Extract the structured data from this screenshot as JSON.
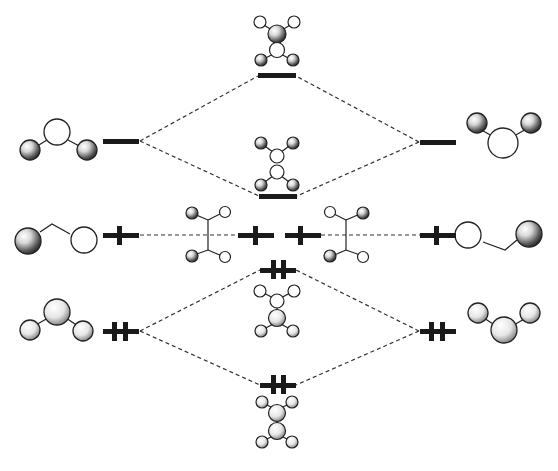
{
  "diagram": {
    "type": "molecular-orbital-energy-diagram",
    "colors": {
      "level": "#1a1a1a",
      "dashed_line": "#333333",
      "lobe_outline": "#222222",
      "filled_lobe_dark": "#1e1e1e",
      "filled_lobe_light": "#ffffff"
    },
    "levels": [
      {
        "id": "left-top",
        "x": 103,
        "y": 141,
        "width": 36,
        "electrons": 0
      },
      {
        "id": "right-top",
        "x": 420,
        "y": 142,
        "width": 36,
        "electrons": 0
      },
      {
        "id": "center-top-upper",
        "x": 258,
        "y": 76,
        "width": 38,
        "electrons": 0
      },
      {
        "id": "center-top-lower",
        "x": 259,
        "y": 196,
        "width": 38,
        "electrons": 0
      },
      {
        "id": "left-mid",
        "x": 103,
        "y": 235,
        "width": 36,
        "electrons": 1
      },
      {
        "id": "center-mid-left",
        "x": 238,
        "y": 235,
        "width": 36,
        "electrons": 1
      },
      {
        "id": "center-mid-right",
        "x": 285,
        "y": 235,
        "width": 36,
        "electrons": 1
      },
      {
        "id": "right-mid",
        "x": 420,
        "y": 235,
        "width": 36,
        "electrons": 1
      },
      {
        "id": "left-bottom",
        "x": 103,
        "y": 331,
        "width": 36,
        "electrons": 2
      },
      {
        "id": "right-bottom",
        "x": 420,
        "y": 331,
        "width": 36,
        "electrons": 2
      },
      {
        "id": "center-bottom-upper",
        "x": 260,
        "y": 270,
        "width": 36,
        "electrons": 2
      },
      {
        "id": "center-bottom-lower",
        "x": 260,
        "y": 385,
        "width": 36,
        "electrons": 2
      }
    ],
    "connections": [
      {
        "from": "left-top",
        "to": "center-top-upper"
      },
      {
        "from": "left-top",
        "to": "center-top-lower"
      },
      {
        "from": "right-top",
        "to": "center-top-upper"
      },
      {
        "from": "right-top",
        "to": "center-top-lower"
      },
      {
        "from": "left-mid",
        "to": "center-mid-left"
      },
      {
        "from": "right-mid",
        "to": "center-mid-right"
      },
      {
        "from": "left-bottom",
        "to": "center-bottom-upper"
      },
      {
        "from": "left-bottom",
        "to": "center-bottom-lower"
      },
      {
        "from": "right-bottom",
        "to": "center-bottom-upper"
      },
      {
        "from": "right-bottom",
        "to": "center-bottom-lower"
      }
    ]
  }
}
